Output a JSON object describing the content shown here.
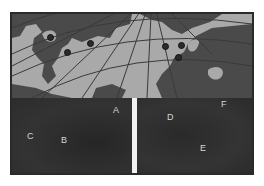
{
  "figure": {
    "map": {
      "description": "Polar-projection map of North Atlantic region with graticule lines",
      "colors": {
        "ocean": "#a9a9a9",
        "land": "#4a4a4a",
        "grid": "#3a3a3a",
        "marker": "#2b2b2b"
      },
      "markers": [
        {
          "id": "marker-1",
          "x": 38,
          "y": 23
        },
        {
          "id": "marker-2",
          "x": 55,
          "y": 38
        },
        {
          "id": "marker-3",
          "x": 78,
          "y": 29
        },
        {
          "id": "marker-4",
          "x": 153,
          "y": 32
        },
        {
          "id": "marker-5",
          "x": 169,
          "y": 31
        },
        {
          "id": "marker-6",
          "x": 166,
          "y": 43
        }
      ]
    },
    "panels": {
      "left": {
        "labels": [
          {
            "text": "A",
            "x": 101,
            "y": 8
          },
          {
            "text": "C",
            "x": 15,
            "y": 34
          },
          {
            "text": "B",
            "x": 49,
            "y": 38
          }
        ]
      },
      "right": {
        "labels": [
          {
            "text": "F",
            "x": 84,
            "y": 2
          },
          {
            "text": "D",
            "x": 30,
            "y": 15
          },
          {
            "text": "E",
            "x": 63,
            "y": 46
          }
        ]
      }
    }
  }
}
